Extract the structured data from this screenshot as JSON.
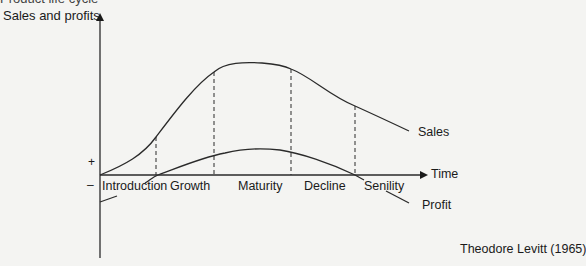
{
  "title": "Product life cycle",
  "diagram": {
    "y_axis_label": "Sales and profits",
    "x_axis_label": "Time",
    "plus_sign": "+",
    "minus_sign": "–",
    "stages": [
      "Introduction",
      "Growth",
      "Maturity",
      "Decline",
      "Senility"
    ],
    "curves": {
      "sales_label": "Sales",
      "profit_label": "Profit"
    },
    "attribution": "Theodore Levitt (1965)"
  },
  "colors": {
    "background": "#f4f4f2",
    "line": "#2a2a2a",
    "text": "#1a1a1a"
  }
}
